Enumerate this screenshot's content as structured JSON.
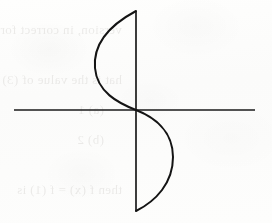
{
  "page": {
    "width": 272,
    "height": 223,
    "background_color": "#fdfdfc",
    "ink_color": "#1a1a1a"
  },
  "figure": {
    "name": "cubic-s-curve-graph",
    "type": "hand-drawn-plot",
    "axes": {
      "horizontal": {
        "y": 110,
        "x_start": 14,
        "x_end": 255,
        "stroke_width": 1.7
      },
      "vertical": {
        "x": 136,
        "y_start": 11,
        "y_end": 211,
        "stroke_width": 1.7
      }
    },
    "origin": {
      "x": 136,
      "y": 110
    },
    "curve": {
      "shape": "s-curve",
      "symmetry": "point-symmetric about origin",
      "stroke_width": 2.0,
      "top_endpoint": {
        "x": 136,
        "y": 11
      },
      "upper_extremum": {
        "x": 95,
        "y": 66
      },
      "crossing": {
        "x": 136,
        "y": 110
      },
      "lower_extremum": {
        "x": 172,
        "y": 158
      },
      "bottom_endpoint": {
        "x": 136,
        "y": 211
      },
      "path": "M 136 11 C 108 26, 93 44, 95 68 C 97 92, 118 103, 136 110 C 154 117, 173 131, 173 157 C 173 183, 156 201, 136 211"
    }
  },
  "bleed_through": {
    "note": "Faint mirror-reversed text showing through from the reverse side of the page",
    "lines": [
      {
        "text": "version, in correct form",
        "x": 150,
        "y": 22,
        "size": 13
      },
      {
        "text": "hat is the value of (3)",
        "x": 150,
        "y": 72,
        "size": 13
      },
      {
        "text": "(a) 1",
        "x": 168,
        "y": 102,
        "size": 13
      },
      {
        "text": "(b) 2",
        "x": 168,
        "y": 132,
        "size": 13
      },
      {
        "text": "then f (x) = f (1) is",
        "x": 150,
        "y": 182,
        "size": 13
      }
    ]
  }
}
